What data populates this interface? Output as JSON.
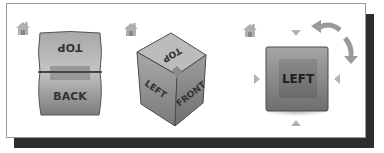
{
  "viewcube_states": [
    {
      "id": "back-view",
      "faces": {
        "top": "TOP",
        "front": "BACK"
      },
      "home_icon": "home-icon"
    },
    {
      "id": "isometric-view",
      "faces": {
        "top": "TOP",
        "left": "LEFT",
        "right": "FRONT"
      },
      "home_icon": "home-icon"
    },
    {
      "id": "left-view",
      "faces": {
        "front": "LEFT"
      },
      "home_icon": "home-icon",
      "arrows": [
        "arrow-down-icon",
        "arrow-right-icon",
        "arrow-left-icon",
        "arrow-up-icon",
        "rotate-ccw-icon",
        "rotate-cw-icon"
      ]
    }
  ],
  "colors": {
    "face_light": "#bdbdbd",
    "face_dark": "#7a7a7a",
    "edge": "#3a3a3a",
    "arrow": "#b3b3b3",
    "shadow": "#2e2e2e"
  }
}
